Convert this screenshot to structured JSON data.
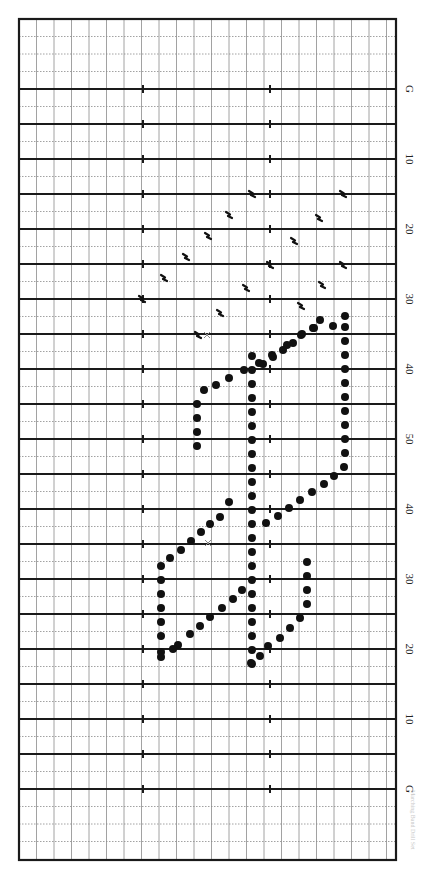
{
  "diagram": {
    "type": "marching-band drill chart (football field)",
    "field": {
      "left_px": 19,
      "right_px": 396,
      "top_px": 19,
      "bottom_px": 860,
      "yard_spacing_px": 35,
      "first_goal_line_px": 89,
      "column_spacing_px": 17.5,
      "hash_x_px": [
        143,
        270
      ],
      "line_color": "#1a1a1a",
      "grid_color": "#8a8a8a"
    },
    "yard_labels": [
      {
        "label": "G",
        "y": 89
      },
      {
        "label": "10",
        "y": 159
      },
      {
        "label": "20",
        "y": 229
      },
      {
        "label": "30",
        "y": 299
      },
      {
        "label": "40",
        "y": 369
      },
      {
        "label": "50",
        "y": 439
      },
      {
        "label": "40",
        "y": 509
      },
      {
        "label": "30",
        "y": 579
      },
      {
        "label": "20",
        "y": 649
      },
      {
        "label": "10",
        "y": 719
      },
      {
        "label": "G",
        "y": 789
      }
    ],
    "performers": [
      [
        197,
        446
      ],
      [
        197,
        432
      ],
      [
        197,
        418
      ],
      [
        197,
        404
      ],
      [
        204,
        390
      ],
      [
        216,
        385
      ],
      [
        229,
        378
      ],
      [
        244,
        370
      ],
      [
        259,
        363
      ],
      [
        272,
        355
      ],
      [
        287,
        345
      ],
      [
        301,
        335
      ],
      [
        313,
        328
      ],
      [
        320,
        320
      ],
      [
        333,
        326
      ],
      [
        252,
        356
      ],
      [
        252,
        370
      ],
      [
        252,
        384
      ],
      [
        252,
        398
      ],
      [
        252,
        412
      ],
      [
        252,
        426
      ],
      [
        252,
        440
      ],
      [
        252,
        454
      ],
      [
        252,
        468
      ],
      [
        252,
        482
      ],
      [
        252,
        496
      ],
      [
        252,
        510
      ],
      [
        252,
        524
      ],
      [
        252,
        538
      ],
      [
        252,
        552
      ],
      [
        252,
        566
      ],
      [
        252,
        580
      ],
      [
        252,
        594
      ],
      [
        252,
        608
      ],
      [
        252,
        622
      ],
      [
        252,
        636
      ],
      [
        252,
        650
      ],
      [
        252,
        664
      ],
      [
        263,
        364
      ],
      [
        273,
        357
      ],
      [
        283,
        350
      ],
      [
        293,
        343
      ],
      [
        302,
        334
      ],
      [
        314,
        328
      ],
      [
        266,
        523
      ],
      [
        278,
        516
      ],
      [
        289,
        508
      ],
      [
        300,
        500
      ],
      [
        312,
        492
      ],
      [
        324,
        484
      ],
      [
        334,
        476
      ],
      [
        344,
        467
      ],
      [
        345,
        453
      ],
      [
        345,
        439
      ],
      [
        345,
        425
      ],
      [
        345,
        411
      ],
      [
        345,
        397
      ],
      [
        345,
        383
      ],
      [
        345,
        369
      ],
      [
        345,
        355
      ],
      [
        345,
        341
      ],
      [
        345,
        327
      ],
      [
        345,
        316
      ],
      [
        161,
        622
      ],
      [
        161,
        608
      ],
      [
        161,
        594
      ],
      [
        161,
        580
      ],
      [
        161,
        566
      ],
      [
        161,
        652
      ],
      [
        161,
        636
      ],
      [
        170,
        558
      ],
      [
        181,
        550
      ],
      [
        191,
        541
      ],
      [
        201,
        532
      ],
      [
        210,
        524
      ],
      [
        220,
        517
      ],
      [
        229,
        502
      ],
      [
        178,
        645
      ],
      [
        190,
        634
      ],
      [
        200,
        626
      ],
      [
        210,
        617
      ],
      [
        222,
        608
      ],
      [
        233,
        599
      ],
      [
        242,
        590
      ],
      [
        307,
        562
      ],
      [
        307,
        576
      ],
      [
        307,
        590
      ],
      [
        307,
        604
      ],
      [
        300,
        618
      ],
      [
        290,
        628
      ],
      [
        280,
        638
      ],
      [
        268,
        646
      ],
      [
        260,
        656
      ],
      [
        251,
        663
      ],
      [
        161,
        657
      ],
      [
        173,
        649
      ]
    ],
    "step_markers": [
      [
        142,
        299
      ],
      [
        164,
        278
      ],
      [
        186,
        257
      ],
      [
        208,
        236
      ],
      [
        229,
        215
      ],
      [
        252,
        194
      ],
      [
        198,
        335
      ],
      [
        220,
        313
      ],
      [
        246,
        288
      ],
      [
        270,
        265
      ],
      [
        294,
        241
      ],
      [
        319,
        218
      ],
      [
        343,
        194
      ],
      [
        301,
        306
      ],
      [
        322,
        285
      ],
      [
        343,
        265
      ]
    ],
    "x_markers": [
      [
        207,
        335
      ],
      [
        208,
        543
      ]
    ],
    "footer_text": "Marching Band Drill Set"
  }
}
